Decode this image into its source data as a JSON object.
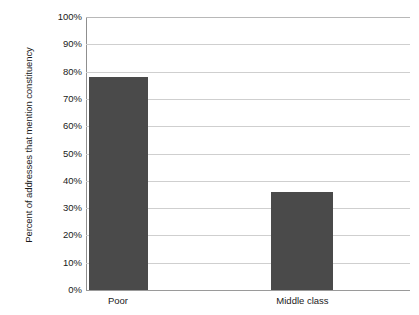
{
  "chart_data": {
    "type": "bar",
    "title": "",
    "subtitle": "",
    "xlabel": "",
    "ylabel": "Percent of addresses that mention constituency",
    "categories": [
      "Poor",
      "Middle class"
    ],
    "values": [
      78,
      36
    ],
    "value_suffix": "%",
    "ylim": [
      0,
      100
    ],
    "ytick_values": [
      100,
      90,
      80,
      70,
      60,
      50,
      40,
      30,
      20,
      10,
      0
    ],
    "ytick_labels": [
      "100%",
      "90%",
      "80%",
      "70%",
      "60%",
      "50%",
      "40%",
      "30%",
      "20%",
      "10%",
      "0%"
    ],
    "grid": true,
    "grid_axis": "y",
    "legend": false,
    "legend_position": "none",
    "series": [
      {
        "name": "Percent of addresses that mention constituency",
        "values": [
          78,
          36
        ],
        "color": "#4a4a4a"
      }
    ]
  },
  "style": {
    "bar_color": "#4a4a4a",
    "gridline_color": "#cfcfcf",
    "axis_color": "#8f8f8f",
    "text_color": "#1a1a1a",
    "background": "#ffffff"
  }
}
